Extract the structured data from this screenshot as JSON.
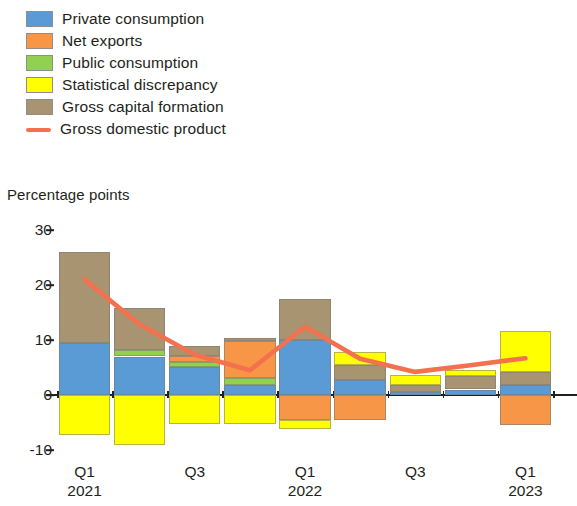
{
  "legend": {
    "items": [
      {
        "label": "Private consumption",
        "color": "#5b9bd5",
        "type": "swatch",
        "icon": "legend-swatch-icon"
      },
      {
        "label": "Net exports",
        "color": "#f79646",
        "type": "swatch",
        "icon": "legend-swatch-icon"
      },
      {
        "label": "Public consumption",
        "color": "#92d050",
        "type": "swatch",
        "icon": "legend-swatch-icon"
      },
      {
        "label": "Statistical discrepancy",
        "color": "#ffff00",
        "type": "swatch",
        "icon": "legend-swatch-icon"
      },
      {
        "label": "Gross capital formation",
        "color": "#a89470",
        "type": "swatch",
        "icon": "legend-swatch-icon"
      },
      {
        "label": "Gross domestic product",
        "color": "#f4714f",
        "type": "line",
        "icon": "legend-line-icon"
      }
    ]
  },
  "axis_title": "Percentage points",
  "chart_data": {
    "type": "bar",
    "stacked": true,
    "title": "",
    "subtitle": "",
    "xlabel": "",
    "ylabel": "Percentage points",
    "ylim": [
      -10,
      30
    ],
    "yticks": [
      30,
      20,
      10,
      0,
      -10
    ],
    "ytick_labels": [
      "30",
      "20",
      "10",
      "0",
      "-10"
    ],
    "grid": false,
    "legend_position": "top-left",
    "x": [
      "Q1 2021",
      "Q2 2021",
      "Q3 2021",
      "Q4 2021",
      "Q1 2022",
      "Q2 2022",
      "Q3 2022",
      "Q4 2022",
      "Q1 2023"
    ],
    "xtick_labels": [
      {
        "quarter": "Q1",
        "year": "2021",
        "index": 0
      },
      {
        "quarter": "Q3",
        "year": "",
        "index": 2
      },
      {
        "quarter": "Q1",
        "year": "2022",
        "index": 4
      },
      {
        "quarter": "Q3",
        "year": "",
        "index": 6
      },
      {
        "quarter": "Q1",
        "year": "2023",
        "index": 8
      }
    ],
    "series": [
      {
        "name": "Private consumption",
        "color": "#5b9bd5",
        "values": [
          9.5,
          7.0,
          5.1,
          1.8,
          10.0,
          2.7,
          0.6,
          1.0,
          1.8
        ]
      },
      {
        "name": "Net exports",
        "color": "#f79646",
        "values": [
          0.0,
          0.0,
          1.1,
          6.7,
          -4.6,
          -4.5,
          0.0,
          0.0,
          -5.5
        ]
      },
      {
        "name": "Public consumption",
        "color": "#92d050",
        "values": [
          0.0,
          1.1,
          0.9,
          1.3,
          0.0,
          0.0,
          0.0,
          0.0,
          0.0
        ]
      },
      {
        "name": "Statistical discrepancy",
        "color": "#ffff00",
        "values": [
          -7.3,
          -9.0,
          -5.3,
          -5.3,
          -1.5,
          2.4,
          1.8,
          1.1,
          7.4
        ]
      },
      {
        "name": "Gross capital formation",
        "color": "#a89470",
        "values": [
          16.5,
          7.7,
          1.9,
          0.5,
          7.5,
          2.7,
          1.3,
          2.4,
          2.4
        ]
      }
    ],
    "line_series": {
      "name": "Gross domestic product",
      "color": "#f4714f",
      "values": [
        21.0,
        12.8,
        7.3,
        4.5,
        12.4,
        6.6,
        4.2,
        5.4,
        6.7
      ]
    }
  }
}
